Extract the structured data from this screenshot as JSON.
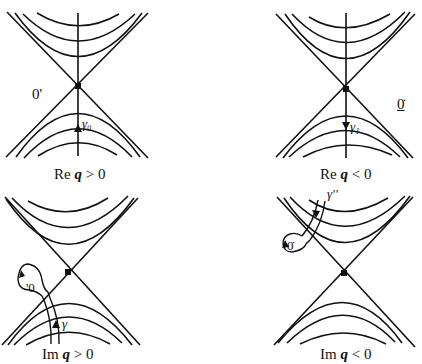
{
  "figure": {
    "panels": [
      {
        "id": "re-q-positive",
        "caption_prefix": "Re",
        "caption_var": "q",
        "caption_rel": " > 0",
        "point_label": "0'",
        "path_label": "γ₀",
        "path_direction": "up"
      },
      {
        "id": "re-q-negative",
        "caption_prefix": "Re",
        "caption_var": "q",
        "caption_rel": " < 0",
        "point_label": "0̇",
        "path_label": "γ₁",
        "path_direction": "down"
      },
      {
        "id": "im-q-positive",
        "caption_prefix": "Im",
        "caption_var": "q",
        "caption_rel": " > 0",
        "point_label": "'0",
        "path_label": "γ",
        "path_direction": "up-with-loop"
      },
      {
        "id": "im-q-negative",
        "caption_prefix": "Im",
        "caption_var": "q",
        "caption_rel": " < 0",
        "point_label": "0̇",
        "path_label": "γ''",
        "path_direction": "down-with-loop"
      }
    ],
    "colors": {
      "ink": "#111111",
      "background": "#ffffff"
    }
  }
}
